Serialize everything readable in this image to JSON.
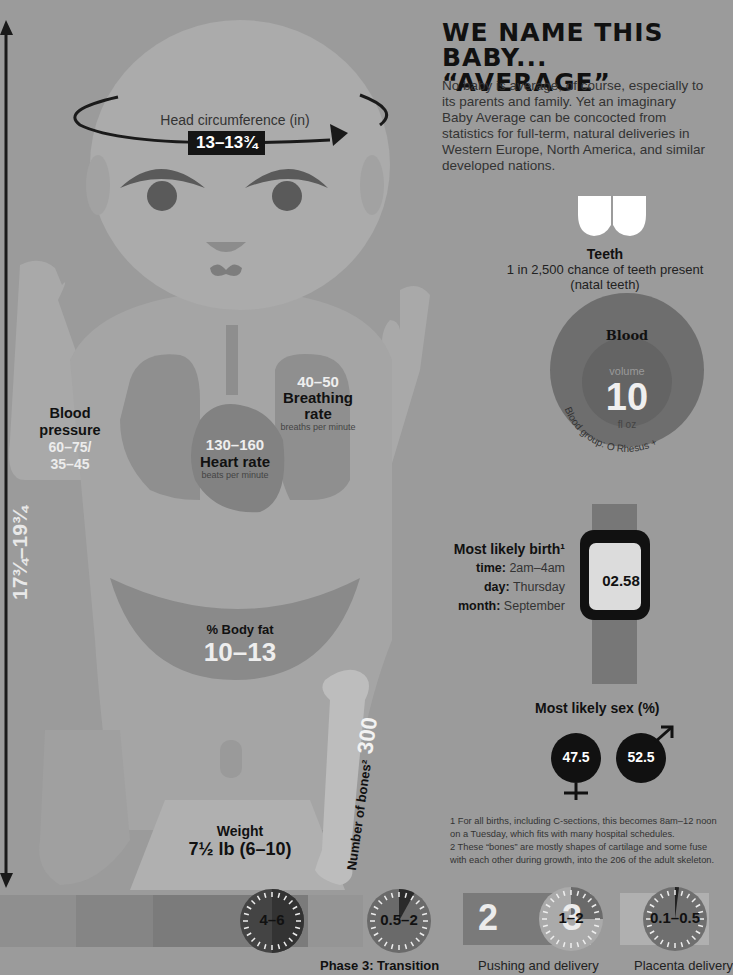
{
  "header": {
    "title_line1": "WE NAME THIS BABY...",
    "title_line2": "“AVERAGE”",
    "intro": "No baby is average, of course, especially to its parents and family. Yet an imaginary Baby Average can be concocted from statistics for full-term, natural deliveries in Western Europe, North America, and similar developed nations."
  },
  "head": {
    "label": "Head circumference (in)",
    "value": "13–13¾"
  },
  "length": {
    "value": "17¾–19¾"
  },
  "blood_pressure": {
    "label_line1": "Blood",
    "label_line2": "pressure",
    "value_line1": "60–75/",
    "value_line2": "35–45"
  },
  "breathing": {
    "value": "40–50",
    "label_line1": "Breathing",
    "label_line2": "rate",
    "unit": "breaths per minute"
  },
  "heart": {
    "value": "130–160",
    "label": "Heart rate",
    "unit": "beats per minute"
  },
  "body_fat": {
    "label": "% Body fat",
    "value": "10–13"
  },
  "weight": {
    "label": "Weight",
    "value": "7½ lb (6–10)"
  },
  "bones": {
    "label": "Number of bones²",
    "value": "300"
  },
  "teeth": {
    "icon": "teeth-icon",
    "label": "Teeth",
    "line1": "1 in 2,500 chance of teeth present",
    "line2": "(natal teeth)"
  },
  "blood": {
    "title": "Blood",
    "volume_label": "volume",
    "volume": "10",
    "unit": "fl oz",
    "group": "Blood group: O Rhesus +"
  },
  "birth": {
    "title": "Most likely birth¹",
    "rows": [
      {
        "key": "time:",
        "value": "2am–4am"
      },
      {
        "key": "day:",
        "value": "Thursday"
      },
      {
        "key": "month:",
        "value": "September"
      }
    ],
    "watch_time": "02.58"
  },
  "sex": {
    "title": "Most likely sex (%)",
    "female": "47.5",
    "male": "52.5"
  },
  "footnotes": [
    "1 For all births, including C-sections, this becomes 8am–12 noon on a Tuesday, which fits with many hospital schedules.",
    "2 These “bones” are mostly shapes of cartilage and some fuse with each other during growth, into the 206 of the adult skeleton."
  ],
  "labor": {
    "dials": [
      {
        "label": "4–6",
        "fraction": 0.5
      },
      {
        "label": "0.5–2",
        "fraction": 0.08
      },
      {
        "label": "1–2",
        "fraction": 0.25
      },
      {
        "label": "0.1–0.5",
        "fraction": 0.02
      }
    ],
    "stage_numbers": [
      "2",
      "3"
    ],
    "phases": [
      "Phase 3: Transition",
      "Pushing and delivery",
      "Placenta delivery"
    ]
  }
}
